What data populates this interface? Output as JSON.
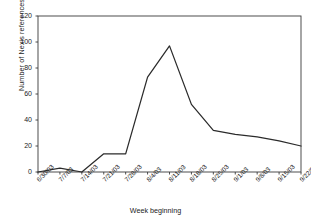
{
  "chart_data": {
    "type": "line",
    "title": "",
    "xlabel": "Week beginning",
    "ylabel": "Number of Nexis references",
    "categories": [
      "6/30/03",
      "7/7/03",
      "7/14/03",
      "7/21/03",
      "7/28/03",
      "8/4/03",
      "8/11/03",
      "8/18/03",
      "8/25/03",
      "9/1/03",
      "9/8/03",
      "9/15/03",
      "9/22/03"
    ],
    "values": [
      0,
      3,
      0,
      14,
      14,
      73,
      97,
      52,
      32,
      29,
      27,
      24,
      20
    ],
    "ylim": [
      0,
      120
    ],
    "yticks": [
      0,
      20,
      40,
      60,
      80,
      100,
      120
    ],
    "grid": false,
    "legend": null,
    "series": [
      {
        "name": "Nexis references",
        "values": [
          0,
          3,
          0,
          14,
          14,
          73,
          97,
          52,
          32,
          29,
          27,
          24,
          20
        ]
      }
    ],
    "line_color": "#2b2b2b",
    "axis_color": "#3a3a3a",
    "background": "#ffffff"
  }
}
